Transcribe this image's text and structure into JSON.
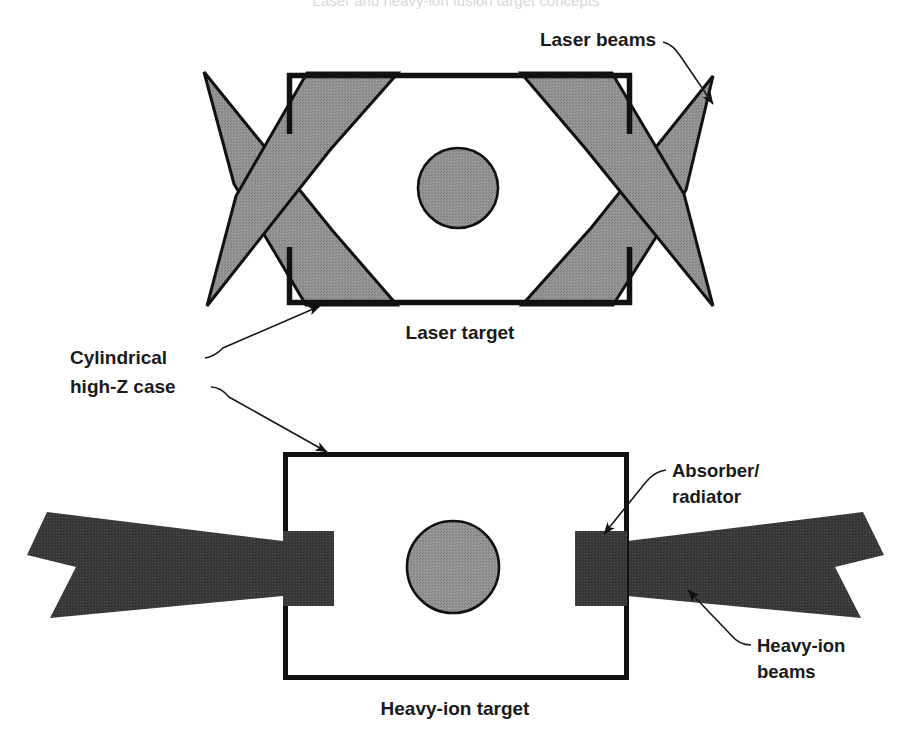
{
  "figure": {
    "title_cropped": "Laser and heavy-ion fusion target concepts",
    "background_color": "#ffffff",
    "width": 913,
    "height": 750
  },
  "colors": {
    "outline": "#111111",
    "laser_beam_gray": "#8c8c8c",
    "capsule_gray": "#8f8f8f",
    "heavy_ion_beam_dark": "#3a3a3a",
    "absorber_dark": "#2f2f2f",
    "label_text": "#1a1a1a"
  },
  "upper_panel": {
    "name": "laser-target-panel",
    "caption": "Laser target",
    "caption_position": {
      "x": 460,
      "y": 338
    },
    "case": {
      "name": "cylindrical-high-z-case",
      "x": 287,
      "y": 73,
      "width": 345,
      "height": 232,
      "stroke_width": 5,
      "has_entrance_holes": true
    },
    "capsule": {
      "name": "fusion-capsule",
      "cx": 458,
      "cy": 188,
      "r": 40,
      "fill": "#8f8f8f"
    },
    "beam_count": 4,
    "beam_label": "Laser beams",
    "beam_label_position": {
      "x": 598,
      "y": 46
    }
  },
  "lower_panel": {
    "name": "heavy-ion-target-panel",
    "caption": "Heavy-ion target",
    "caption_position": {
      "x": 455,
      "y": 714
    },
    "case": {
      "name": "cylindrical-high-z-case",
      "x": 283,
      "y": 452,
      "width": 344,
      "height": 226,
      "stroke_width": 5
    },
    "capsule": {
      "name": "fusion-capsule",
      "cx": 453,
      "cy": 567,
      "r": 46,
      "fill": "#8f8f8f"
    },
    "absorbers": [
      {
        "name": "absorber-left",
        "x": 283,
        "y": 531,
        "width": 51,
        "height": 74
      },
      {
        "name": "absorber-right",
        "x": 575,
        "y": 531,
        "width": 52,
        "height": 75
      }
    ],
    "beam_count": 2,
    "beam_label": "Heavy-ion beams",
    "beam_label_position": {
      "x": 757,
      "y": 652
    },
    "absorber_label": "Absorber/\nradiator",
    "absorber_label_lines": [
      "Absorber/",
      "radiator"
    ],
    "absorber_label_position": {
      "x": 672,
      "y": 477
    }
  },
  "annotations": [
    {
      "name": "laser-beams-callout",
      "text": "Laser beams",
      "text_x": 598,
      "text_y": 46,
      "anchor": "middle",
      "lines": 1
    },
    {
      "name": "cylindrical-high-z-case-callout",
      "text_lines": [
        "Cylindrical",
        "high-Z case"
      ],
      "text_x": 70,
      "text_y": 364,
      "anchor": "start",
      "lines": 2
    },
    {
      "name": "laser-target-caption",
      "text": "Laser target",
      "text_x": 460,
      "text_y": 338,
      "anchor": "middle",
      "lines": 1
    },
    {
      "name": "absorber-radiator-callout",
      "text_lines": [
        "Absorber/",
        "radiator"
      ],
      "text_x": 672,
      "text_y": 477,
      "anchor": "start",
      "lines": 2
    },
    {
      "name": "heavy-ion-beams-callout",
      "text_lines": [
        "Heavy-ion",
        "beams"
      ],
      "text_x": 757,
      "text_y": 652,
      "anchor": "start",
      "lines": 2
    },
    {
      "name": "heavy-ion-target-caption",
      "text": "Heavy-ion target",
      "text_x": 455,
      "text_y": 714,
      "anchor": "middle",
      "lines": 1
    }
  ],
  "labels": {
    "laser_beams": "Laser beams",
    "cylindrical_line1": "Cylindrical",
    "cylindrical_line2": "high-Z case",
    "laser_target": "Laser target",
    "absorber_line1": "Absorber/",
    "absorber_line2": "radiator",
    "heavy_ion_line1": "Heavy-ion",
    "heavy_ion_line2": "beams",
    "heavy_ion_target": "Heavy-ion target"
  }
}
